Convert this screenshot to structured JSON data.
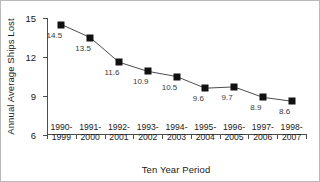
{
  "chart_data": {
    "type": "line",
    "title": "",
    "xlabel": "Ten Year Period",
    "ylabel": "Annual Average Ships Lost",
    "categories": [
      "1990-1999",
      "1991-2000",
      "1992-2001",
      "1993-2002",
      "1994-2003",
      "1995-2004",
      "1996-2005",
      "1997-2006",
      "1998-2007"
    ],
    "category_lines": [
      [
        "1990-",
        "1999"
      ],
      [
        "1991-",
        "2000"
      ],
      [
        "1992-",
        "2001"
      ],
      [
        "1993-",
        "2002"
      ],
      [
        "1994-",
        "2003"
      ],
      [
        "1995-",
        "2004"
      ],
      [
        "1996-",
        "2005"
      ],
      [
        "1997-",
        "2006"
      ],
      [
        "1998-",
        "2007"
      ]
    ],
    "values": [
      14.5,
      13.5,
      11.6,
      10.9,
      10.5,
      9.6,
      9.7,
      8.9,
      8.6
    ],
    "point_labels": [
      "14.5",
      "13.5",
      "11.6",
      "10.9",
      "10.5",
      "9.6",
      "9.7",
      "8.9",
      "8.6"
    ],
    "ylim": [
      6,
      15
    ],
    "yticks": [
      6,
      9,
      12,
      15
    ],
    "ytick_labels": [
      "6",
      "9",
      "12",
      "15"
    ],
    "grid": false,
    "legend": "none",
    "marker": "square",
    "series_color": "#111111",
    "line_color": "#4d4d4d",
    "label_color": "#3a3a3a"
  }
}
